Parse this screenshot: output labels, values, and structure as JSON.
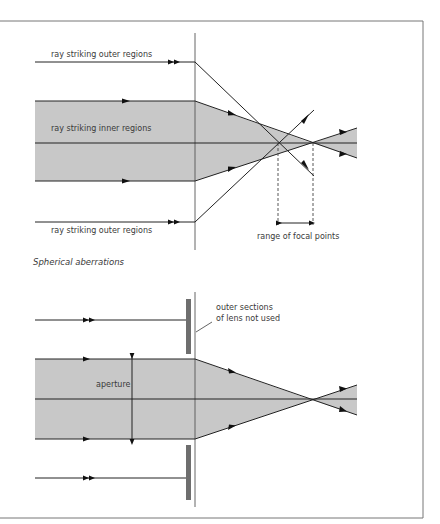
{
  "figure": {
    "caption": "Spherical aberrations",
    "colors": {
      "beam_fill": "#c8c8c8",
      "stop_fill": "#6e6e6e",
      "ray": "#222222",
      "frame": "#777777",
      "text": "#3a3a3a"
    }
  },
  "top_diagram": {
    "labels": {
      "outer_top": "ray striking outer regions",
      "inner": "ray striking inner regions",
      "outer_bottom": "ray striking outer regions",
      "range": "range of focal points"
    }
  },
  "bottom_diagram": {
    "labels": {
      "stop_note_line1": "outer sections",
      "stop_note_line2": "of lens not used",
      "aperture": "aperture"
    }
  }
}
